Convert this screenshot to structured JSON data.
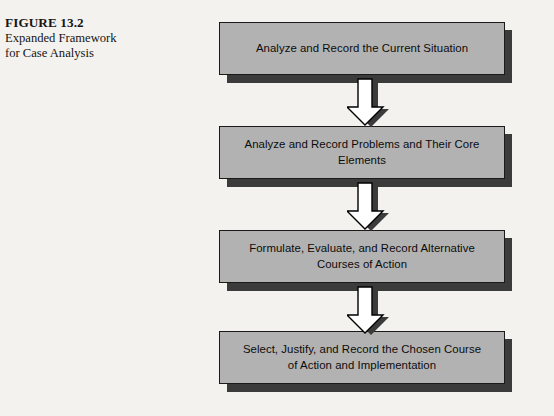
{
  "figure": {
    "caption_title": "FIGURE 13.2",
    "caption_line_1": "Expanded Framework",
    "caption_line_2": "for Case Analysis",
    "background_color": "#f4f2ee",
    "box_fill_color": "#b2b2b2",
    "box_border_color": "#1a1a1a",
    "shadow_color": "#3b3b3b",
    "arrow_fill_color": "#ffffff",
    "arrow_outline_color": "#000000"
  },
  "flow": {
    "steps": [
      {
        "label": "Analyze and Record the Current Situation",
        "order": "1"
      },
      {
        "label": "Analyze and Record Problems and Their Core Elements",
        "order": "2"
      },
      {
        "label": "Formulate, Evaluate, and Record Alternative\nCourses of Action",
        "order": "3"
      },
      {
        "label": "Select, Justify, and Record the Chosen Course\nof Action and Implementation",
        "order": "4"
      }
    ],
    "connectors": [
      {
        "name": "arrow-step-1-to-2",
        "direction": "down"
      },
      {
        "name": "arrow-step-2-to-3",
        "direction": "down"
      },
      {
        "name": "arrow-step-3-to-4",
        "direction": "down"
      }
    ]
  }
}
